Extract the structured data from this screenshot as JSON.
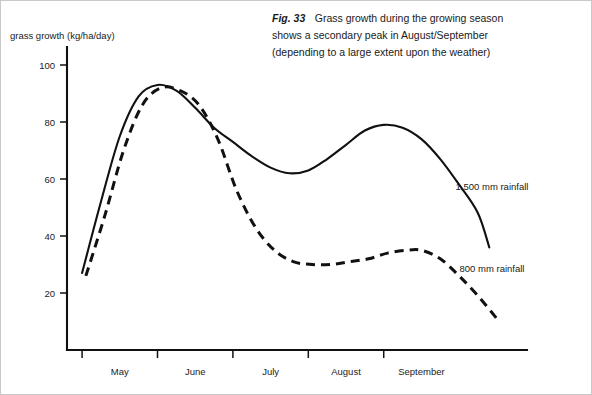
{
  "figure": {
    "caption_figure_number": "Fig. 33",
    "caption_lines": [
      "Grass growth during the growing season",
      "shows a secondary peak in August/September",
      "(depending to a large extent upon the weather)"
    ],
    "ink_color": "#111111",
    "background_color": "#ffffff"
  },
  "chart_data": {
    "type": "line",
    "title": "Fig. 33 Grass growth during the growing season shows a secondary peak in August/September (depending to a large extent upon the weather)",
    "xlabel": "",
    "ylabel": "grass growth (kg/ha/day)",
    "ylim": [
      0,
      110
    ],
    "yticks": [
      20,
      40,
      60,
      80,
      100
    ],
    "ytick_labels": [
      "20",
      "40",
      "60",
      "80",
      "100"
    ],
    "xlim": [
      3.8,
      9.9
    ],
    "xtick_labels": [
      "May",
      "June",
      "July",
      "August",
      "September"
    ],
    "xtick_positions": [
      4.5,
      5.5,
      6.5,
      7.5,
      8.5
    ],
    "grid": false,
    "legend_position": "inline-right",
    "series": [
      {
        "name": "1,500 mm rainfall",
        "style": "solid",
        "color": "#111111",
        "x": [
          4.0,
          4.25,
          4.5,
          4.75,
          5.0,
          5.25,
          5.5,
          5.75,
          6.0,
          6.25,
          6.5,
          6.75,
          7.0,
          7.25,
          7.5,
          7.75,
          8.0,
          8.25,
          8.5,
          8.75,
          9.0,
          9.25,
          9.4
        ],
        "y": [
          27,
          52,
          75,
          89,
          93,
          91,
          85,
          78,
          73,
          68,
          64,
          62,
          63,
          67,
          72,
          77,
          79,
          78,
          74,
          67,
          58,
          48,
          36
        ]
      },
      {
        "name": "800 mm rainfall",
        "style": "dashed",
        "color": "#111111",
        "x": [
          4.05,
          4.3,
          4.55,
          4.8,
          5.05,
          5.3,
          5.55,
          5.8,
          6.05,
          6.3,
          6.55,
          6.8,
          7.05,
          7.3,
          7.55,
          7.8,
          8.05,
          8.3,
          8.5,
          8.75,
          9.0,
          9.25,
          9.5
        ],
        "y": [
          26,
          47,
          70,
          86,
          92,
          91,
          86,
          74,
          56,
          43,
          35,
          31,
          30,
          30,
          31,
          32,
          34,
          35,
          35,
          32,
          26,
          19,
          11
        ]
      }
    ],
    "annotations": [
      {
        "text": "1,500 mm rainfall",
        "series": "1,500 mm rainfall"
      },
      {
        "text": "800 mm rainfall",
        "series": "800 mm rainfall"
      }
    ]
  }
}
